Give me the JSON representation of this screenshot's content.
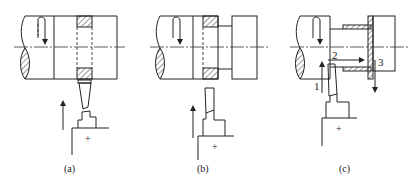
{
  "figure": {
    "panels": [
      {
        "id": "a",
        "caption": "(a)"
      },
      {
        "id": "b",
        "caption": "(b)"
      },
      {
        "id": "c",
        "caption": "(c)",
        "step_labels": [
          "1",
          "2",
          "3"
        ]
      }
    ],
    "tool_base_mark": "+",
    "colors": {
      "line": "#222222",
      "background": "#ffffff"
    }
  }
}
